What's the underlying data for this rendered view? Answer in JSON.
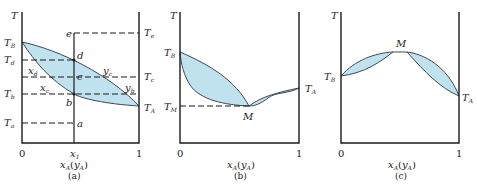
{
  "figure": {
    "panels": [
      {
        "id": "a",
        "caption": "(a)",
        "y_axis_label": "T",
        "x_axis_label": "xA(yA)",
        "x_ticks": [
          "0",
          "x1",
          "1"
        ],
        "labels": {
          "TB": "T",
          "TB_sub": "B",
          "TA": "T",
          "TA_sub": "A",
          "Td": "T",
          "Td_sub": "d",
          "Tb": "T",
          "Tb_sub": "b",
          "Ta": "T",
          "Ta_sub": "a",
          "Te": "T",
          "Te_sub": "e",
          "Tc": "T",
          "Tc_sub": "c",
          "xd": "x",
          "xd_sub": "d",
          "xc": "x",
          "xc_sub": "c",
          "yc": "y",
          "yc_sub": "c",
          "yb": "y",
          "yb_sub": "b",
          "points": [
            "a",
            "b",
            "c",
            "d",
            "e"
          ]
        }
      },
      {
        "id": "b",
        "caption": "(b)",
        "y_axis_label": "T",
        "x_axis_label": "xA(yA)",
        "x_ticks": [
          "0",
          "1"
        ],
        "labels": {
          "TB": "T",
          "TB_sub": "B",
          "TA": "T",
          "TA_sub": "A",
          "TM": "T",
          "TM_sub": "M",
          "M": "M"
        }
      },
      {
        "id": "c",
        "caption": "(c)",
        "y_axis_label": "T",
        "x_axis_label": "xA(yA)",
        "x_ticks": [
          "0",
          "1"
        ],
        "labels": {
          "TB": "T",
          "TB_sub": "B",
          "TA": "T",
          "TA_sub": "A",
          "M": "M"
        }
      }
    ],
    "colors": {
      "region_fill": "#bfe2ee",
      "line": "#1a1a1a"
    }
  }
}
